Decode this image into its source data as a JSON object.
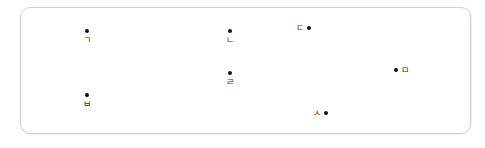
{
  "diagram": {
    "frame": {
      "border_color": "#cfcfcf",
      "background": "#ffffff"
    },
    "points": [
      {
        "id": "giyeok",
        "label": "ㄱ",
        "layout": "dot-above"
      },
      {
        "id": "nieun",
        "label": "ㄴ",
        "layout": "dot-above"
      },
      {
        "id": "digeut",
        "label": "ㄷ",
        "layout": "dot-right"
      },
      {
        "id": "rieul",
        "label": "ㄹ",
        "layout": "dot-above"
      },
      {
        "id": "mieum",
        "label": "ㅁ",
        "layout": "dot-left"
      },
      {
        "id": "bieup",
        "label": "ㅂ",
        "layout": "dot-above"
      },
      {
        "id": "siot",
        "label": "ㅅ",
        "layout": "dot-right"
      }
    ],
    "dot_color": "#111111",
    "label_color": "#333333"
  }
}
